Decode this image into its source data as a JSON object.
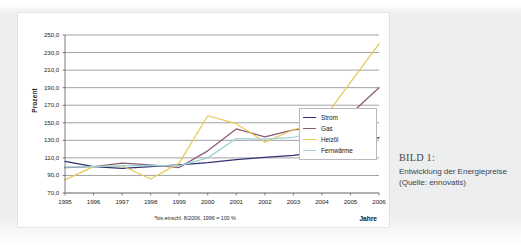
{
  "caption": {
    "title": "BILD 1:",
    "body": "Entwicklung der Energiepreise (Quelle: ennovatis)"
  },
  "chart_data": {
    "type": "line",
    "title": "",
    "xlabel": "Jahre",
    "ylabel": "Prozent",
    "footnote": "*bis einschl. 8/2006, 1996 = 100 %",
    "grid": true,
    "legend_position": "right-inside",
    "xlim": [
      1995,
      2006
    ],
    "ylim": [
      70.0,
      250.0
    ],
    "ytick_step": 20,
    "x": [
      1995,
      1996,
      1997,
      1998,
      1999,
      2000,
      2001,
      2002,
      2003,
      2004,
      2005,
      2006
    ],
    "xtick_labels": [
      "1995",
      "1996",
      "1997",
      "1998",
      "1999",
      "2000",
      "2001",
      "2002",
      "2003",
      "2004",
      "2005",
      "2006"
    ],
    "ytick_labels": [
      "250,0",
      "230,0",
      "210,0",
      "190,0",
      "170,0",
      "150,0",
      "130,0",
      "110,0",
      "90,0",
      "70,0"
    ],
    "ytick_values": [
      250.0,
      230.0,
      210.0,
      190.0,
      170.0,
      150.0,
      130.0,
      110.0,
      90.0,
      70.0
    ],
    "series": [
      {
        "name": "Strom",
        "color": "#2f3174",
        "values": [
          106.0,
          100.0,
          98.0,
          100.0,
          102.0,
          104.5,
          108.0,
          110.5,
          113.0,
          117.0,
          124.0,
          133.0
        ]
      },
      {
        "name": "Gas",
        "color": "#8d5a78",
        "values": [
          99.0,
          100.0,
          104.0,
          102.0,
          99.0,
          118.0,
          143.0,
          134.0,
          142.0,
          145.0,
          160.0,
          190.0
        ]
      },
      {
        "name": "Heizöl",
        "color": "#e8c95a",
        "values": [
          85.0,
          100.0,
          101.0,
          86.0,
          104.0,
          158.0,
          149.0,
          128.0,
          142.0,
          152.0,
          196.0,
          240.0
        ]
      },
      {
        "name": "Fernwärme",
        "color": "#9fd2d6",
        "values": [
          99.5,
          100.0,
          101.0,
          101.5,
          101.0,
          110.0,
          132.0,
          131.5,
          133.5,
          140.0,
          null,
          null
        ]
      }
    ]
  }
}
